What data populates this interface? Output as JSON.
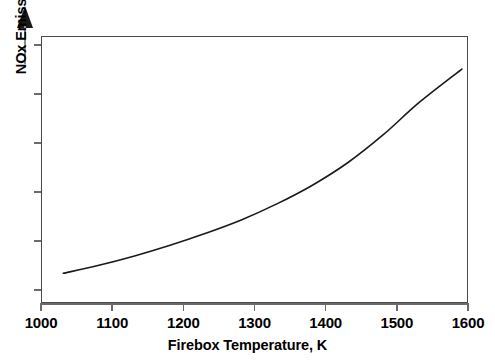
{
  "chart_data": {
    "type": "line",
    "title": "",
    "subtitle": "",
    "xlabel": "Firebox Temperature, K",
    "ylabel": "NOx Emissions, Increasing",
    "xlim": [
      1000,
      1600
    ],
    "ylim": [
      0,
      100
    ],
    "grid": false,
    "legend": null,
    "x_ticks": [
      1000,
      1100,
      1200,
      1300,
      1400,
      1500,
      1600
    ],
    "x_tick_labels": [
      "1000",
      "1100",
      "1200",
      "1300",
      "1400",
      "1500",
      "1600"
    ],
    "y_ticks_unlabeled_count": 6,
    "y_tick_labels": [],
    "annotations": [
      {
        "name": "y-axis-increasing-arrow",
        "description": "upward arrow above y-axis indicating increasing NOx emissions"
      }
    ],
    "series": [
      {
        "name": "NOx emissions vs firebox temperature",
        "x": [
          1030,
          1080,
          1130,
          1180,
          1230,
          1280,
          1330,
          1380,
          1430,
          1480,
          1530,
          1590
        ],
        "y": [
          11.5,
          14.5,
          18.0,
          22.0,
          26.5,
          31.5,
          37.5,
          44.5,
          53.0,
          63.5,
          75.5,
          88.0
        ],
        "style": "smooth-curve",
        "color": "#1a1a1a"
      }
    ]
  },
  "axis": {
    "x_title": "Firebox Temperature, K",
    "y_title": "NOx Emissions, Increasing",
    "tick_labels": [
      "1000",
      "1100",
      "1200",
      "1300",
      "1400",
      "1500",
      "1600"
    ]
  },
  "colors": {
    "curve": "#1a1a1a",
    "frame": "#4a4a4a",
    "tick": "#6b6b6b",
    "arrow": "#1a1a1a",
    "arrow_shaft": "#8c8c8c",
    "background": "#ffffff",
    "text": "#000000"
  }
}
